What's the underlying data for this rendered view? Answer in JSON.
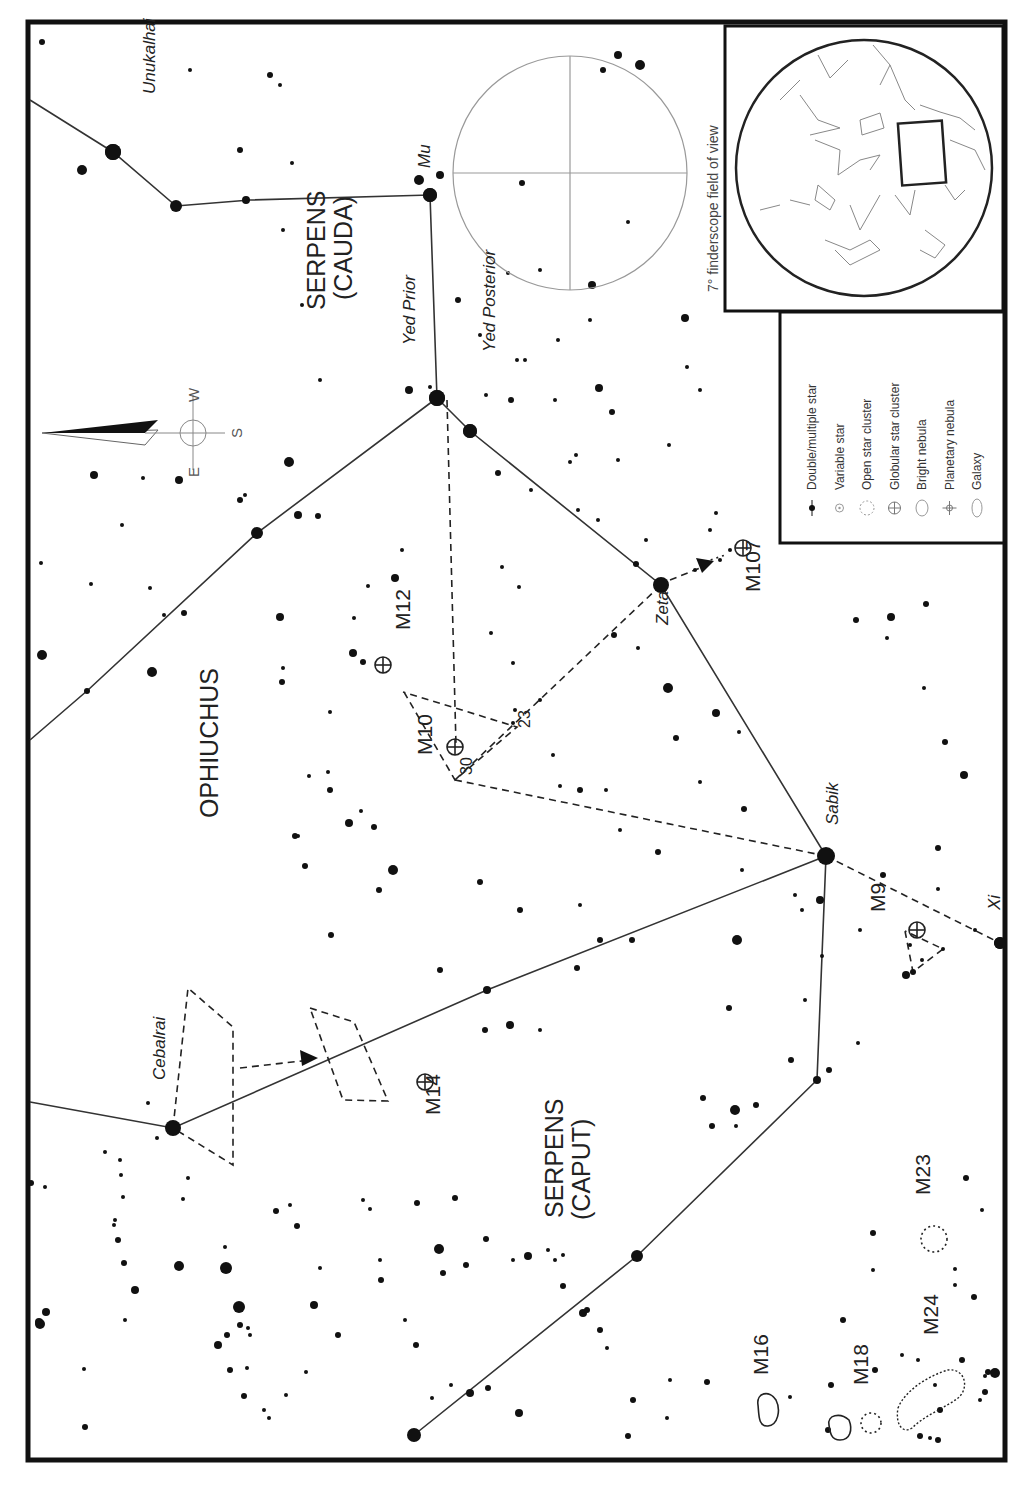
{
  "chart_title": "Ophiuchus / Serpens finder chart",
  "labels": {
    "constellations": [
      {
        "id": "serpens-cauda-1",
        "text": "SERPENS",
        "x": 325,
        "y": 310
      },
      {
        "id": "serpens-cauda-2",
        "text": "(CAUDA)",
        "x": 352,
        "y": 300
      },
      {
        "id": "ophiuchus",
        "text": "OPHIUCHUS",
        "x": 218,
        "y": 818
      },
      {
        "id": "serpens-caput-1",
        "text": "SERPENS",
        "x": 563,
        "y": 1218
      },
      {
        "id": "serpens-caput-2",
        "text": "(CAPUT)",
        "x": 590,
        "y": 1220
      }
    ],
    "stars": [
      {
        "id": "unukalhai",
        "text": "Unukalhai",
        "x": 155,
        "y": 94
      },
      {
        "id": "mu",
        "text": "Mu",
        "x": 430,
        "y": 168
      },
      {
        "id": "yed-prior",
        "text": "Yed Prior",
        "x": 415,
        "y": 345
      },
      {
        "id": "yed-posterior",
        "text": "Yed Posterior",
        "x": 495,
        "y": 352
      },
      {
        "id": "zeta",
        "text": "Zeta",
        "x": 668,
        "y": 625
      },
      {
        "id": "sabik",
        "text": "Sabik",
        "x": 838,
        "y": 825
      },
      {
        "id": "xi",
        "text": "Xi",
        "x": 1000,
        "y": 910
      },
      {
        "id": "cebalrai",
        "text": "Cebalrai",
        "x": 165,
        "y": 1080
      }
    ],
    "objects": [
      {
        "id": "m12",
        "text": "M12",
        "x": 410,
        "y": 630
      },
      {
        "id": "m10",
        "text": "M10",
        "x": 432,
        "y": 755
      },
      {
        "id": "m107",
        "text": "M107",
        "x": 760,
        "y": 592
      },
      {
        "id": "m9",
        "text": "M9",
        "x": 885,
        "y": 912
      },
      {
        "id": "m14",
        "text": "M14",
        "x": 440,
        "y": 1115
      },
      {
        "id": "m23",
        "text": "M23",
        "x": 930,
        "y": 1195
      },
      {
        "id": "m16",
        "text": "M16",
        "x": 768,
        "y": 1375
      },
      {
        "id": "m18",
        "text": "M18",
        "x": 868,
        "y": 1385
      },
      {
        "id": "m24",
        "text": "M24",
        "x": 938,
        "y": 1335
      }
    ],
    "numbers": [
      {
        "id": "star-23",
        "text": "23",
        "x": 530,
        "y": 728
      },
      {
        "id": "star-30",
        "text": "30",
        "x": 472,
        "y": 775
      }
    ]
  },
  "compass": {
    "e": "E",
    "w": "W",
    "s": "S"
  },
  "finderscope_inset": {
    "caption": "7° finderscope field of view"
  },
  "legend": {
    "items": [
      {
        "symbol": "double-star",
        "label": "Double/multiple star"
      },
      {
        "symbol": "variable-star",
        "label": "Variable star"
      },
      {
        "symbol": "open-cluster",
        "label": "Open star cluster"
      },
      {
        "symbol": "globular-cluster",
        "label": "Globular star cluster"
      },
      {
        "symbol": "bright-nebula",
        "label": "Bright nebula"
      },
      {
        "symbol": "planetary-nebula",
        "label": "Planetary nebula"
      },
      {
        "symbol": "galaxy",
        "label": "Galaxy"
      }
    ]
  },
  "colors": {
    "ink": "#111111",
    "paper": "#ffffff",
    "grid": "#999999"
  },
  "stars_plotted": [
    [
      113,
      152,
      8
    ],
    [
      82,
      170,
      5
    ],
    [
      176,
      206,
      6
    ],
    [
      42,
      42,
      3
    ],
    [
      246,
      200,
      4
    ],
    [
      240,
      150,
      3
    ],
    [
      292,
      163,
      2
    ],
    [
      430,
      195,
      7
    ],
    [
      419,
      180,
      5
    ],
    [
      440,
      175,
      4
    ],
    [
      437,
      398,
      8
    ],
    [
      470,
      431,
      7
    ],
    [
      409,
      390,
      4
    ],
    [
      430,
      387,
      2
    ],
    [
      283,
      230,
      2
    ],
    [
      190,
      70,
      2
    ],
    [
      270,
      75,
      3
    ],
    [
      280,
      85,
      2
    ],
    [
      302,
      305,
      2
    ],
    [
      320,
      380,
      2
    ],
    [
      94,
      475,
      4
    ],
    [
      143,
      478,
      2
    ],
    [
      179,
      480,
      4
    ],
    [
      289,
      462,
      5
    ],
    [
      257,
      533,
      6
    ],
    [
      298,
      515,
      4
    ],
    [
      240,
      500,
      3
    ],
    [
      245,
      495,
      2
    ],
    [
      318,
      516,
      3
    ],
    [
      122,
      525,
      2
    ],
    [
      41,
      563,
      2
    ],
    [
      91,
      584,
      2
    ],
    [
      150,
      588,
      2
    ],
    [
      184,
      613,
      3
    ],
    [
      164,
      615,
      2
    ],
    [
      87,
      691,
      3
    ],
    [
      42,
      655,
      5
    ],
    [
      152,
      672,
      5
    ],
    [
      280,
      617,
      4
    ],
    [
      282,
      682,
      3
    ],
    [
      283,
      668,
      2
    ],
    [
      354,
      618,
      2
    ],
    [
      353,
      653,
      4
    ],
    [
      368,
      586,
      2
    ],
    [
      363,
      662,
      3
    ],
    [
      395,
      578,
      4
    ],
    [
      402,
      550,
      2
    ],
    [
      330,
      712,
      2
    ],
    [
      309,
      776,
      2
    ],
    [
      349,
      823,
      4
    ],
    [
      330,
      790,
      3
    ],
    [
      374,
      827,
      3
    ],
    [
      295,
      836,
      3
    ],
    [
      361,
      811,
      2
    ],
    [
      393,
      870,
      5
    ],
    [
      305,
      866,
      3
    ],
    [
      328,
      772,
      2
    ],
    [
      298,
      836,
      2
    ],
    [
      331,
      935,
      3
    ],
    [
      379,
      890,
      3
    ],
    [
      480,
      882,
      3
    ],
    [
      520,
      910,
      3
    ],
    [
      487,
      990,
      4
    ],
    [
      440,
      970,
      3
    ],
    [
      510,
      1025,
      4
    ],
    [
      485,
      1030,
      3
    ],
    [
      540,
      1030,
      2
    ],
    [
      577,
      968,
      3
    ],
    [
      600,
      940,
      3
    ],
    [
      632,
      940,
      3
    ],
    [
      658,
      852,
      3
    ],
    [
      668,
      688,
      5
    ],
    [
      676,
      738,
      3
    ],
    [
      700,
      782,
      2
    ],
    [
      716,
      713,
      4
    ],
    [
      739,
      732,
      2
    ],
    [
      744,
      809,
      3
    ],
    [
      742,
      870,
      2
    ],
    [
      737,
      940,
      5
    ],
    [
      729,
      1008,
      3
    ],
    [
      703,
      1098,
      3
    ],
    [
      712,
      1126,
      3
    ],
    [
      735,
      1110,
      5
    ],
    [
      736,
      1126,
      2
    ],
    [
      756,
      1105,
      3
    ],
    [
      791,
      1060,
      3
    ],
    [
      805,
      1000,
      2
    ],
    [
      822,
      956,
      2
    ],
    [
      829,
      1070,
      3
    ],
    [
      858,
      1043,
      2
    ],
    [
      887,
      638,
      2
    ],
    [
      856,
      620,
      3
    ],
    [
      891,
      617,
      4
    ],
    [
      926,
      604,
      3
    ],
    [
      924,
      688,
      2
    ],
    [
      945,
      742,
      3
    ],
    [
      964,
      775,
      4
    ],
    [
      938,
      848,
      3
    ],
    [
      975,
      930,
      2
    ],
    [
      906,
      975,
      4
    ],
    [
      922,
      960,
      2
    ],
    [
      938,
      889,
      2
    ],
    [
      883,
      875,
      3
    ],
    [
      860,
      930,
      2
    ],
    [
      830,
      860,
      2
    ],
    [
      820,
      900,
      4
    ],
    [
      795,
      895,
      2
    ],
    [
      802,
      910,
      2
    ],
    [
      817,
      1080,
      4
    ],
    [
      1000,
      943,
      6
    ],
    [
      913,
      972,
      3
    ],
    [
      943,
      949,
      2
    ],
    [
      910,
      945,
      2
    ],
    [
      620,
      830,
      2
    ],
    [
      606,
      790,
      2
    ],
    [
      580,
      790,
      3
    ],
    [
      580,
      905,
      2
    ],
    [
      515,
      710,
      2
    ],
    [
      513,
      723,
      2
    ],
    [
      618,
      55,
      4
    ],
    [
      640,
      65,
      5
    ],
    [
      603,
      70,
      3
    ],
    [
      592,
      285,
      4
    ],
    [
      508,
      273,
      2
    ],
    [
      522,
      183,
      3
    ],
    [
      525,
      360,
      2
    ],
    [
      558,
      340,
      2
    ],
    [
      590,
      320,
      2
    ],
    [
      628,
      222,
      2
    ],
    [
      685,
      318,
      4
    ],
    [
      687,
      367,
      2
    ],
    [
      700,
      390,
      2
    ],
    [
      669,
      445,
      2
    ],
    [
      646,
      540,
      2
    ],
    [
      636,
      564,
      3
    ],
    [
      614,
      635,
      3
    ],
    [
      638,
      648,
      2
    ],
    [
      695,
      570,
      2
    ],
    [
      710,
      530,
      2
    ],
    [
      720,
      560,
      2
    ],
    [
      730,
      550,
      2
    ],
    [
      716,
      513,
      2
    ],
    [
      578,
      510,
      2
    ],
    [
      570,
      462,
      2
    ],
    [
      531,
      490,
      2
    ],
    [
      511,
      400,
      3
    ],
    [
      486,
      395,
      2
    ],
    [
      480,
      335,
      2
    ],
    [
      458,
      300,
      3
    ],
    [
      540,
      270,
      2
    ],
    [
      517,
      360,
      2
    ],
    [
      555,
      400,
      2
    ],
    [
      576,
      455,
      2
    ],
    [
      599,
      388,
      4
    ],
    [
      612,
      412,
      3
    ],
    [
      618,
      460,
      2
    ],
    [
      598,
      520,
      2
    ],
    [
      498,
      473,
      3
    ],
    [
      502,
      567,
      2
    ],
    [
      519,
      587,
      2
    ],
    [
      491,
      633,
      2
    ],
    [
      513,
      663,
      2
    ],
    [
      540,
      700,
      2
    ],
    [
      553,
      755,
      2
    ],
    [
      560,
      786,
      2
    ],
    [
      40,
      1324,
      5
    ],
    [
      85,
      1427,
      3
    ],
    [
      45,
      1187,
      2
    ],
    [
      31,
      1183,
      3
    ],
    [
      120,
      1160,
      2
    ],
    [
      121,
      1175,
      2
    ],
    [
      123,
      1197,
      2
    ],
    [
      115,
      1220,
      2
    ],
    [
      118,
      1240,
      3
    ],
    [
      124,
      1263,
      3
    ],
    [
      135,
      1290,
      4
    ],
    [
      125,
      1320,
      2
    ],
    [
      84,
      1369,
      2
    ],
    [
      46,
      1312,
      4
    ],
    [
      39,
      1322,
      4
    ],
    [
      179,
      1266,
      5
    ],
    [
      226,
      1268,
      6
    ],
    [
      239,
      1307,
      6
    ],
    [
      218,
      1345,
      4
    ],
    [
      240,
      1325,
      3
    ],
    [
      248,
      1328,
      2
    ],
    [
      250,
      1335,
      2
    ],
    [
      230,
      1370,
      3
    ],
    [
      247,
      1368,
      2
    ],
    [
      244,
      1396,
      3
    ],
    [
      264,
      1410,
      2
    ],
    [
      269,
      1418,
      2
    ],
    [
      286,
      1395,
      2
    ],
    [
      306,
      1372,
      2
    ],
    [
      314,
      1305,
      4
    ],
    [
      320,
      1268,
      2
    ],
    [
      297,
      1226,
      3
    ],
    [
      276,
      1211,
      3
    ],
    [
      290,
      1205,
      2
    ],
    [
      188,
      1178,
      2
    ],
    [
      183,
      1199,
      2
    ],
    [
      114,
      1225,
      2
    ],
    [
      105,
      1152,
      2
    ],
    [
      157,
      1138,
      2
    ],
    [
      148,
      1103,
      2
    ],
    [
      225,
      1247,
      2
    ],
    [
      227,
      1335,
      3
    ],
    [
      338,
      1335,
      3
    ],
    [
      363,
      1200,
      2
    ],
    [
      370,
      1209,
      2
    ],
    [
      380,
      1260,
      2
    ],
    [
      381,
      1280,
      3
    ],
    [
      405,
      1320,
      2
    ],
    [
      416,
      1345,
      3
    ],
    [
      432,
      1398,
      2
    ],
    [
      470,
      1393,
      4
    ],
    [
      488,
      1388,
      3
    ],
    [
      414,
      1435,
      7
    ],
    [
      451,
      1385,
      2
    ],
    [
      519,
      1413,
      4
    ],
    [
      466,
      1265,
      3
    ],
    [
      486,
      1239,
      3
    ],
    [
      513,
      1260,
      2
    ],
    [
      528,
      1256,
      4
    ],
    [
      417,
      1203,
      3
    ],
    [
      439,
      1249,
      5
    ],
    [
      443,
      1273,
      3
    ],
    [
      455,
      1198,
      3
    ],
    [
      548,
      1250,
      2
    ],
    [
      555,
      1260,
      2
    ],
    [
      563,
      1255,
      2
    ],
    [
      583,
      1313,
      4
    ],
    [
      587,
      1310,
      3
    ],
    [
      600,
      1330,
      3
    ],
    [
      607,
      1348,
      2
    ],
    [
      563,
      1286,
      3
    ],
    [
      637,
      1256,
      6
    ],
    [
      633,
      1400,
      3
    ],
    [
      628,
      1436,
      3
    ],
    [
      670,
      1380,
      2
    ],
    [
      707,
      1382,
      3
    ],
    [
      667,
      1418,
      2
    ],
    [
      790,
      1397,
      2
    ],
    [
      828,
      1430,
      3
    ],
    [
      831,
      1385,
      3
    ],
    [
      843,
      1320,
      3
    ],
    [
      873,
      1233,
      3
    ],
    [
      873,
      1270,
      2
    ],
    [
      875,
      1370,
      3
    ],
    [
      918,
      1360,
      2
    ],
    [
      955,
      1269,
      2
    ],
    [
      955,
      1285,
      2
    ],
    [
      962,
      1360,
      3
    ],
    [
      988,
      1372,
      3
    ],
    [
      985,
      1376,
      2
    ],
    [
      995,
      1373,
      5
    ],
    [
      985,
      1392,
      3
    ],
    [
      982,
      1210,
      2
    ],
    [
      974,
      1297,
      3
    ],
    [
      966,
      1178,
      3
    ],
    [
      902,
      1355,
      2
    ],
    [
      935,
      1385,
      2
    ],
    [
      940,
      1410,
      3
    ],
    [
      980,
      1400,
      2
    ],
    [
      938,
      1440,
      3
    ],
    [
      930,
      1438,
      2
    ],
    [
      920,
      1436,
      3
    ]
  ],
  "bright_stars": [
    {
      "name": "unukalhai",
      "x": 113,
      "y": 152,
      "r": 8
    },
    {
      "name": "mu",
      "x": 430,
      "y": 195,
      "r": 7
    },
    {
      "name": "yed-prior",
      "x": 437,
      "y": 398,
      "r": 8
    },
    {
      "name": "yed-posterior",
      "x": 470,
      "y": 431,
      "r": 7
    },
    {
      "name": "zeta",
      "x": 661,
      "y": 585,
      "r": 8
    },
    {
      "name": "sabik",
      "x": 826,
      "y": 856,
      "r": 9
    },
    {
      "name": "xi",
      "x": 1000,
      "y": 943,
      "r": 6
    },
    {
      "name": "cebalrai",
      "x": 173,
      "y": 1128,
      "r": 8
    }
  ]
}
